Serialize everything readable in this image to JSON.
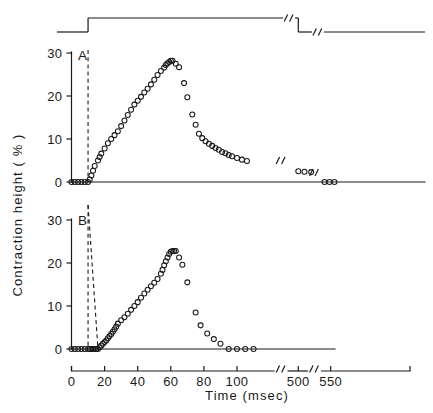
{
  "chart_data": {
    "type": "scatter",
    "title": "",
    "xlabel": "Time (msec)",
    "ylabel": "Contraction height ( % )",
    "xlim": [
      0,
      570
    ],
    "ylim": [
      0,
      31
    ],
    "grid": false,
    "legend": null,
    "x_ticks": [
      {
        "value": 0,
        "label": "0"
      },
      {
        "value": 20,
        "label": "20"
      },
      {
        "value": 40,
        "label": "40"
      },
      {
        "value": 60,
        "label": "60"
      },
      {
        "value": 80,
        "label": "80"
      },
      {
        "value": 100,
        "label": "100"
      },
      {
        "value": 500,
        "label": "500"
      },
      {
        "value": 550,
        "label": "550"
      }
    ],
    "y_ticks": [
      {
        "value": 0,
        "label": "0"
      },
      {
        "value": 10,
        "label": "10"
      },
      {
        "value": 20,
        "label": "20"
      },
      {
        "value": 30,
        "label": "30"
      }
    ],
    "axis_breaks_x": [
      {
        "after": 120,
        "before": 490
      },
      {
        "after": 510,
        "before": 540
      }
    ],
    "stimulus_trace": {
      "name": "stimulus-pulse",
      "baseline_level": 0,
      "high_level": 1,
      "rise_time": 10,
      "fall_time": 500,
      "breaks": [
        {
          "position": 440
        },
        {
          "position": 530
        }
      ]
    },
    "dashed_markers": [
      {
        "name": "stimulus-onset",
        "x": 10
      },
      {
        "name": "contraction-onset-b",
        "x_top": 10,
        "x_bottom": 16
      }
    ],
    "panels": [
      {
        "label": "A",
        "series_name": "contraction-height-a",
        "peak_value": 28.2,
        "peak_time": 59,
        "points": [
          [
            0,
            0
          ],
          [
            2,
            0
          ],
          [
            4,
            0
          ],
          [
            6,
            0
          ],
          [
            8,
            0
          ],
          [
            10,
            0
          ],
          [
            11,
            0.6
          ],
          [
            12,
            1.5
          ],
          [
            13,
            2.6
          ],
          [
            14,
            3.7
          ],
          [
            16,
            5.0
          ],
          [
            17,
            5.8
          ],
          [
            18,
            6.6
          ],
          [
            20,
            7.8
          ],
          [
            22,
            9.0
          ],
          [
            24,
            10.0
          ],
          [
            26,
            10.9
          ],
          [
            28,
            11.8
          ],
          [
            30,
            13.0
          ],
          [
            32,
            14.3
          ],
          [
            34,
            15.6
          ],
          [
            36,
            16.8
          ],
          [
            38,
            18.0
          ],
          [
            40,
            18.9
          ],
          [
            42,
            19.8
          ],
          [
            44,
            20.8
          ],
          [
            46,
            21.7
          ],
          [
            48,
            22.7
          ],
          [
            50,
            23.8
          ],
          [
            52,
            24.9
          ],
          [
            54,
            25.8
          ],
          [
            56,
            26.6
          ],
          [
            57,
            27.2
          ],
          [
            58,
            27.6
          ],
          [
            59,
            27.9
          ],
          [
            60,
            28.2
          ],
          [
            61,
            28.2
          ],
          [
            63,
            27.5
          ],
          [
            65,
            26.7
          ],
          [
            68,
            23.0
          ],
          [
            70,
            19.7
          ],
          [
            73,
            15.7
          ],
          [
            75,
            13.3
          ],
          [
            77,
            11.2
          ],
          [
            79,
            10.2
          ],
          [
            81,
            9.5
          ],
          [
            83,
            8.9
          ],
          [
            85,
            8.4
          ],
          [
            87,
            7.9
          ],
          [
            89,
            7.5
          ],
          [
            91,
            7.0
          ],
          [
            93,
            6.7
          ],
          [
            95,
            6.3
          ],
          [
            97,
            6.0
          ],
          [
            100,
            5.6
          ],
          [
            103,
            5.2
          ],
          [
            106,
            4.9
          ],
          [
            500,
            2.5
          ],
          [
            510,
            2.4
          ],
          [
            520,
            2.3
          ],
          [
            540,
            0
          ],
          [
            548,
            0
          ],
          [
            556,
            0
          ]
        ]
      },
      {
        "label": "B",
        "series_name": "contraction-height-b",
        "peak_value": 22.8,
        "peak_time": 62,
        "points": [
          [
            0,
            0
          ],
          [
            2,
            0
          ],
          [
            4,
            0
          ],
          [
            6,
            0
          ],
          [
            8,
            0
          ],
          [
            10,
            0
          ],
          [
            11,
            0
          ],
          [
            12,
            0
          ],
          [
            13,
            0
          ],
          [
            14,
            0
          ],
          [
            15,
            0
          ],
          [
            16,
            0
          ],
          [
            17,
            0.4
          ],
          [
            18,
            0.8
          ],
          [
            19,
            1.2
          ],
          [
            20,
            1.6
          ],
          [
            21,
            2.0
          ],
          [
            22,
            2.5
          ],
          [
            23,
            3.0
          ],
          [
            24,
            3.5
          ],
          [
            25,
            4.0
          ],
          [
            26,
            4.6
          ],
          [
            27,
            5.2
          ],
          [
            28,
            5.9
          ],
          [
            30,
            6.7
          ],
          [
            32,
            7.4
          ],
          [
            34,
            8.2
          ],
          [
            36,
            9.1
          ],
          [
            38,
            10.0
          ],
          [
            40,
            10.9
          ],
          [
            42,
            11.9
          ],
          [
            44,
            12.9
          ],
          [
            46,
            13.8
          ],
          [
            48,
            14.6
          ],
          [
            50,
            15.4
          ],
          [
            52,
            16.3
          ],
          [
            54,
            17.5
          ],
          [
            55,
            18.4
          ],
          [
            56,
            19.5
          ],
          [
            57,
            20.4
          ],
          [
            58,
            21.3
          ],
          [
            59,
            22.1
          ],
          [
            60,
            22.6
          ],
          [
            61,
            22.8
          ],
          [
            62,
            22.8
          ],
          [
            63,
            22.8
          ],
          [
            65,
            21.3
          ],
          [
            67,
            19.6
          ],
          [
            70,
            15.5
          ],
          [
            75,
            8.5
          ],
          [
            78,
            5.5
          ],
          [
            82,
            3.6
          ],
          [
            86,
            2.3
          ],
          [
            90,
            1.2
          ],
          [
            95,
            0
          ],
          [
            100,
            0
          ],
          [
            105,
            0
          ],
          [
            110,
            0
          ]
        ]
      }
    ]
  },
  "labels": {
    "panel_a": "A",
    "panel_b": "B",
    "x_axis_title": "Time (msec)",
    "y_axis_title": "Contraction height ( % )"
  }
}
